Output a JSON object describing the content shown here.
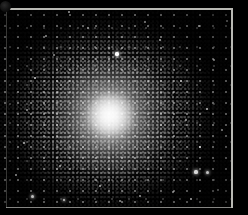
{
  "image": {
    "subject": "globular star cluster",
    "caption": "Globular cluster",
    "medium": "grayscale astronomical photograph",
    "background_color": "#000000",
    "frame_color": "#b9b9b4",
    "core_color": "#ffffff",
    "halo_color": "#bebebe",
    "width": 248,
    "height": 215
  },
  "frame": {
    "top_label": "frame-top-edge",
    "right_label": "frame-right-edge",
    "bottom_label": "frame-bottom-edge",
    "left_label": "frame-left-edge"
  },
  "cluster": {
    "center_x": 108,
    "center_y": 114,
    "core_label": "cluster-core",
    "halo_label": "cluster-halo",
    "nucleus_label": "cluster-nucleus"
  },
  "stars": [
    {
      "x": 117,
      "y": 54,
      "r": 1.6,
      "b": 1.0,
      "glow": true
    },
    {
      "x": 196,
      "y": 172,
      "r": 1.6,
      "b": 1.0,
      "glow": true
    },
    {
      "x": 207,
      "y": 172,
      "r": 1.5,
      "b": 0.96,
      "glow": true
    },
    {
      "x": 32,
      "y": 196,
      "r": 1.5,
      "b": 0.94,
      "glow": true
    },
    {
      "x": 64,
      "y": 200,
      "r": 1.4,
      "b": 0.9,
      "glow": true
    },
    {
      "x": 191,
      "y": 199,
      "r": 1.3,
      "b": 0.88,
      "glow": false
    },
    {
      "x": 200,
      "y": 147,
      "r": 1.3,
      "b": 0.86,
      "glow": false
    },
    {
      "x": 207,
      "y": 109,
      "r": 1.2,
      "b": 0.84,
      "glow": false
    },
    {
      "x": 199,
      "y": 26,
      "r": 1.2,
      "b": 0.82,
      "glow": false
    },
    {
      "x": 227,
      "y": 21,
      "r": 1.1,
      "b": 0.78,
      "glow": false
    },
    {
      "x": 69,
      "y": 12,
      "r": 1.1,
      "b": 0.76,
      "glow": false
    },
    {
      "x": 35,
      "y": 78,
      "r": 1.2,
      "b": 0.8,
      "glow": false
    },
    {
      "x": 24,
      "y": 143,
      "r": 1.1,
      "b": 0.74,
      "glow": false
    },
    {
      "x": 16,
      "y": 175,
      "r": 1.0,
      "b": 0.7,
      "glow": false
    },
    {
      "x": 181,
      "y": 81,
      "r": 1.1,
      "b": 0.74,
      "glow": false
    },
    {
      "x": 160,
      "y": 40,
      "r": 1.0,
      "b": 0.7,
      "glow": false
    },
    {
      "x": 88,
      "y": 28,
      "r": 1.0,
      "b": 0.68,
      "glow": false
    },
    {
      "x": 140,
      "y": 196,
      "r": 1.0,
      "b": 0.66,
      "glow": false
    },
    {
      "x": 100,
      "y": 186,
      "r": 1.0,
      "b": 0.66,
      "glow": false
    },
    {
      "x": 214,
      "y": 60,
      "r": 1.0,
      "b": 0.64,
      "glow": false
    },
    {
      "x": 46,
      "y": 36,
      "r": 0.9,
      "b": 0.62,
      "glow": false
    },
    {
      "x": 222,
      "y": 130,
      "r": 0.9,
      "b": 0.62,
      "glow": false
    },
    {
      "x": 173,
      "y": 192,
      "r": 0.9,
      "b": 0.6,
      "glow": false
    },
    {
      "x": 60,
      "y": 166,
      "r": 0.9,
      "b": 0.6,
      "glow": false
    },
    {
      "x": 145,
      "y": 22,
      "r": 0.9,
      "b": 0.58,
      "glow": false
    },
    {
      "x": 27,
      "y": 110,
      "r": 0.9,
      "b": 0.58,
      "glow": false
    },
    {
      "x": 218,
      "y": 190,
      "r": 0.9,
      "b": 0.56,
      "glow": false
    },
    {
      "x": 120,
      "y": 201,
      "r": 0.8,
      "b": 0.54,
      "glow": false
    },
    {
      "x": 186,
      "y": 120,
      "r": 0.8,
      "b": 0.54,
      "glow": false
    },
    {
      "x": 54,
      "y": 55,
      "r": 0.8,
      "b": 0.52,
      "glow": false
    }
  ]
}
